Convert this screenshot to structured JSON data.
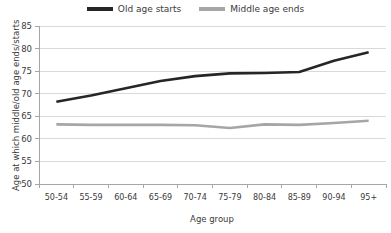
{
  "chart_data": {
    "type": "line",
    "title": "",
    "xlabel": "Age group",
    "ylabel": "Age at which middle/old age ends/starts",
    "categories": [
      "50-54",
      "55-59",
      "60-64",
      "65-69",
      "70-74",
      "75-79",
      "80-84",
      "85-89",
      "90-94",
      "95+"
    ],
    "ylim": [
      50,
      85
    ],
    "yticks": [
      50,
      55,
      60,
      65,
      70,
      75,
      80,
      85
    ],
    "grid": true,
    "legend_position": "top-center",
    "series": [
      {
        "name": "Old age starts",
        "color": "#262626",
        "values": [
          68.2,
          69.6,
          71.2,
          72.8,
          73.9,
          74.5,
          74.6,
          74.8,
          77.3,
          79.2
        ]
      },
      {
        "name": "Middle age ends",
        "color": "#a6a6a6",
        "values": [
          63.2,
          63.1,
          63.1,
          63.1,
          63.0,
          62.4,
          63.2,
          63.1,
          63.5,
          64.0
        ]
      }
    ]
  },
  "legend": {
    "entries": [
      {
        "label": "Old age starts",
        "swatch_icon": "line-swatch-dark"
      },
      {
        "label": "Middle age ends",
        "swatch_icon": "line-swatch-gray"
      }
    ]
  },
  "axes": {
    "y_title": "Age at which middle/old age ends/starts",
    "x_title": "Age group",
    "y_tick_labels": [
      "85",
      "80",
      "75",
      "70",
      "65",
      "60",
      "55",
      "50"
    ],
    "x_tick_labels": [
      "50-54",
      "55-59",
      "60-64",
      "65-69",
      "70-74",
      "75-79",
      "80-84",
      "85-89",
      "90-94",
      "95+"
    ]
  },
  "colors": {
    "series_old_age": "#262626",
    "series_middle_age": "#a6a6a6",
    "gridline": "#d9d9d9",
    "axis": "#a6a6a6",
    "text": "#3a3a3a",
    "background": "#ffffff"
  }
}
